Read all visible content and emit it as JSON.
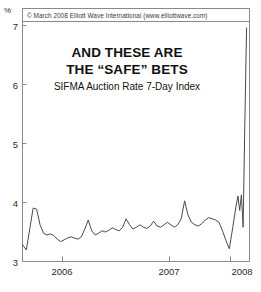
{
  "copyright": "© March 2008 Elliott Wave International (www.elliottwave.com)",
  "titles": {
    "line1": "AND THESE ARE",
    "line2": "THE “SAFE” BETS",
    "subtitle": "SIFMA Auction Rate 7-Day Index"
  },
  "axis": {
    "unit_label": "%",
    "y_ticks": [
      "3",
      "4",
      "5",
      "6",
      "7"
    ],
    "x_ticks": [
      "2006",
      "2007",
      "2008"
    ]
  },
  "colors": {
    "line": "#4a4a4a",
    "frame": "#8a8a8a",
    "text": "#2b2b2b",
    "background": "#ffffff"
  },
  "chart_data": {
    "type": "line",
    "title": "AND THESE ARE THE “SAFE” BETS",
    "subtitle": "SIFMA Auction Rate 7-Day Index",
    "xlabel": "",
    "ylabel": "%",
    "ylim": [
      3,
      7
    ],
    "xlim": [
      2005.45,
      2008.1
    ],
    "y_ticks": [
      3,
      4,
      5,
      6,
      7
    ],
    "x_ticks": [
      2006,
      2007,
      2008
    ],
    "grid": false,
    "legend": null,
    "series": [
      {
        "name": "SIFMA Auction Rate 7-Day Index",
        "x": [
          2005.45,
          2005.5,
          2005.54,
          2005.58,
          2005.62,
          2005.66,
          2005.7,
          2005.74,
          2005.78,
          2005.82,
          2005.86,
          2005.9,
          2005.94,
          2005.98,
          2006.02,
          2006.06,
          2006.1,
          2006.14,
          2006.18,
          2006.22,
          2006.26,
          2006.3,
          2006.34,
          2006.38,
          2006.42,
          2006.46,
          2006.5,
          2006.54,
          2006.58,
          2006.62,
          2006.66,
          2006.7,
          2006.74,
          2006.78,
          2006.82,
          2006.86,
          2006.9,
          2006.94,
          2006.98,
          2007.02,
          2007.06,
          2007.1,
          2007.14,
          2007.18,
          2007.22,
          2007.26,
          2007.3,
          2007.34,
          2007.38,
          2007.42,
          2007.46,
          2007.5,
          2007.54,
          2007.58,
          2007.62,
          2007.66,
          2007.7,
          2007.74,
          2007.78,
          2007.82,
          2007.86,
          2007.9,
          2007.94,
          2007.96,
          2007.98,
          2008.0,
          2008.02,
          2008.04,
          2008.06
        ],
        "y": [
          3.3,
          3.2,
          3.55,
          3.9,
          3.88,
          3.62,
          3.48,
          3.45,
          3.47,
          3.44,
          3.38,
          3.34,
          3.37,
          3.4,
          3.42,
          3.4,
          3.38,
          3.42,
          3.55,
          3.7,
          3.52,
          3.45,
          3.48,
          3.52,
          3.5,
          3.53,
          3.57,
          3.54,
          3.52,
          3.58,
          3.72,
          3.62,
          3.55,
          3.58,
          3.62,
          3.58,
          3.56,
          3.6,
          3.68,
          3.6,
          3.58,
          3.62,
          3.66,
          3.62,
          3.58,
          3.62,
          3.72,
          4.02,
          3.78,
          3.66,
          3.62,
          3.6,
          3.64,
          3.7,
          3.74,
          3.72,
          3.7,
          3.66,
          3.52,
          3.36,
          3.22,
          3.58,
          3.95,
          4.1,
          3.86,
          4.12,
          3.58,
          5.3,
          6.9
        ]
      }
    ],
    "annotations": [
      {
        "text": "© March 2008 Elliott Wave International (www.elliottwave.com)",
        "position": "top"
      }
    ]
  }
}
